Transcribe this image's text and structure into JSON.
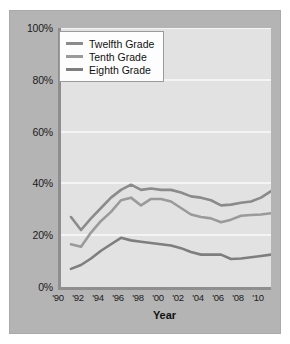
{
  "chart_data": {
    "type": "line",
    "title": "",
    "xlabel": "Year",
    "ylabel": "",
    "grid": true,
    "legend_position": "top-left-inside",
    "xlim": [
      1990,
      2011
    ],
    "ylim": [
      0,
      100
    ],
    "ytick_labels": [
      "100%",
      "80%",
      "60%",
      "40%",
      "20%",
      "0%"
    ],
    "ytick_values": [
      100,
      80,
      60,
      40,
      20,
      0
    ],
    "xtick_labels": [
      "'90",
      "'92",
      "'94",
      "'96",
      "'98",
      "'00",
      "'02",
      "'04",
      "'06",
      "'08",
      "'10"
    ],
    "xtick_values": [
      1990,
      1992,
      1994,
      1996,
      1998,
      2000,
      2002,
      2004,
      2006,
      2008,
      2010
    ],
    "x": [
      1991,
      1992,
      1993,
      1994,
      1995,
      1996,
      1997,
      1998,
      1999,
      2000,
      2001,
      2002,
      2003,
      2004,
      2005,
      2006,
      2007,
      2008,
      2009,
      2010,
      2011
    ],
    "series": [
      {
        "name": "Twelfth Grade",
        "color": "#8b8b8b",
        "values": [
          27.0,
          22.0,
          26.5,
          30.5,
          34.5,
          37.5,
          39.5,
          37.5,
          38.0,
          37.5,
          37.5,
          36.5,
          35.0,
          34.5,
          33.5,
          31.5,
          31.8,
          32.5,
          33.0,
          34.5,
          37.0
        ]
      },
      {
        "name": "Tenth Grade",
        "color": "#9a9a9a",
        "values": [
          16.5,
          15.5,
          21.0,
          25.5,
          29.0,
          33.5,
          34.5,
          31.5,
          34.0,
          34.0,
          33.0,
          30.5,
          28.0,
          27.0,
          26.5,
          25.0,
          26.0,
          27.5,
          27.8,
          28.0,
          28.5
        ]
      },
      {
        "name": "Eighth Grade",
        "color": "#7e7e7e",
        "values": [
          7.0,
          8.5,
          11.0,
          14.0,
          16.5,
          19.0,
          18.0,
          17.5,
          17.0,
          16.5,
          16.0,
          15.0,
          13.5,
          12.5,
          12.5,
          12.5,
          10.8,
          11.0,
          11.5,
          12.0,
          12.5
        ]
      }
    ]
  },
  "axis": {
    "x_title": "Year"
  },
  "legend": {
    "items": [
      {
        "label": "Twelfth Grade"
      },
      {
        "label": "Tenth Grade"
      },
      {
        "label": "Eighth Grade"
      }
    ]
  },
  "colors": {
    "panel": "#b4b4b4",
    "plot_background": "#e2e2e2",
    "gridline": "#f4f4f4",
    "axis": "#8e8e8e",
    "text": "#1b1b1b"
  }
}
